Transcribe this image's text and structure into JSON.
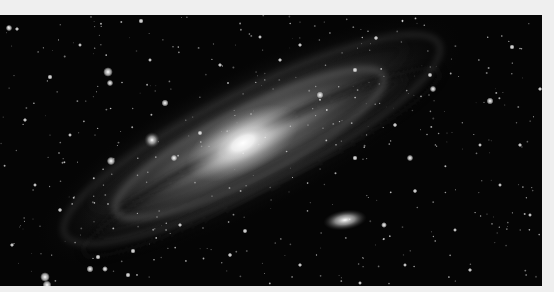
{
  "image": {
    "subject": "Andromeda galaxy (spiral galaxy) with companion galaxy and field stars",
    "alt": "Grayscale astrophotograph of a large spiral galaxy tilted diagonally across a star field, with a smaller elliptical companion galaxy below-right of the core"
  },
  "colors": {
    "page_background": "#efefef",
    "sky": "#050505",
    "core": "#ffffff",
    "arms": "#9a9a9a"
  },
  "galaxy": {
    "core": {
      "cx": 243,
      "cy": 128,
      "rx": 45,
      "ry": 22,
      "rotation": -27
    },
    "disk": {
      "cx": 250,
      "cy": 125,
      "rx": 220,
      "ry": 62,
      "rotation": -27
    },
    "companion": {
      "cx": 345,
      "cy": 205,
      "rx": 18,
      "ry": 8,
      "rotation": -8
    },
    "companion_small": {
      "cx": 152,
      "cy": 125,
      "r": 6
    }
  },
  "stars": [
    [
      108,
      57,
      3
    ],
    [
      110,
      68,
      2
    ],
    [
      9,
      13,
      2
    ],
    [
      141,
      6,
      1.6
    ],
    [
      50,
      62,
      1.6
    ],
    [
      165,
      88,
      2.2
    ],
    [
      320,
      80,
      2.2
    ],
    [
      433,
      74,
      2
    ],
    [
      490,
      86,
      2.2
    ],
    [
      111,
      146,
      2.6
    ],
    [
      174,
      143,
      2
    ],
    [
      200,
      118,
      1.5
    ],
    [
      355,
      55,
      1.6
    ],
    [
      410,
      143,
      2
    ],
    [
      430,
      60,
      1.5
    ],
    [
      512,
      32,
      1.6
    ],
    [
      45,
      262,
      3
    ],
    [
      47,
      270,
      2.8
    ],
    [
      90,
      254,
      2.2
    ],
    [
      98,
      242,
      1.6
    ],
    [
      105,
      254,
      1.8
    ],
    [
      133,
      236,
      1.6
    ],
    [
      128,
      260,
      1.6
    ],
    [
      17,
      14,
      1.3
    ],
    [
      245,
      216,
      1.5
    ],
    [
      384,
      210,
      1.8
    ],
    [
      415,
      176,
      1.4
    ],
    [
      470,
      255,
      1.3
    ],
    [
      500,
      170,
      1.2
    ],
    [
      280,
      45,
      1.3
    ],
    [
      300,
      30,
      1.3
    ],
    [
      376,
      23,
      1.4
    ],
    [
      540,
      74,
      1.3
    ],
    [
      60,
      195,
      1.4
    ],
    [
      25,
      105,
      1.3
    ],
    [
      70,
      120,
      1.2
    ],
    [
      520,
      130,
      1.3
    ],
    [
      455,
      215,
      1.2
    ],
    [
      300,
      250,
      1.3
    ],
    [
      230,
      240,
      1.4
    ],
    [
      180,
      210,
      1.3
    ],
    [
      355,
      143,
      1.6
    ],
    [
      395,
      110,
      1.4
    ],
    [
      260,
      22,
      1.2
    ],
    [
      220,
      50,
      1.3
    ],
    [
      150,
      45,
      1.2
    ],
    [
      80,
      30,
      1.2
    ],
    [
      35,
      170,
      1.2
    ],
    [
      12,
      230,
      1.3
    ],
    [
      480,
      130,
      1.2
    ],
    [
      530,
      200,
      1.2
    ],
    [
      405,
      250,
      1.2
    ],
    [
      360,
      268,
      1.2
    ]
  ]
}
